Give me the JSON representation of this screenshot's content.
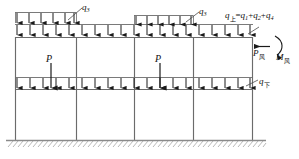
{
  "diagram": {
    "colors": {
      "structure": "#6b6b6b",
      "load": "#1a1a1a",
      "ground": "#8a8a8a",
      "text": "#111111"
    },
    "labels": {
      "q3_left": "q",
      "q3_left_sub": "3",
      "q3_right": "q",
      "q3_right_sub": "3",
      "q_upper_sym": "q",
      "q_upper_sub": "上",
      "q_upper_eq": "=",
      "q_upper_rhs_1": "q",
      "q_upper_rhs_1_sub": "1",
      "q_upper_plus_1": "+",
      "q_upper_rhs_2": "q",
      "q_upper_rhs_2_sub": "2",
      "q_upper_plus_2": "+",
      "q_upper_rhs_3": "q",
      "q_upper_rhs_3_sub": "4",
      "q_lower_sym": "q",
      "q_lower_sub": "下",
      "p_left": "P",
      "p_right": "P",
      "p_wind_sym": "P",
      "p_wind_sub": "风",
      "m_wind_sym": "M",
      "m_wind_sub": "风"
    },
    "geometry": {
      "columns_x": [
        15,
        76,
        134,
        193,
        252
      ],
      "beam_top_y": 37,
      "beam_mid_y": 89,
      "ground_y": 140,
      "udl_upper_row_y": 31,
      "udl_q3_row_y": 19,
      "udl_lower_row_y": 83,
      "q3_left_span": [
        15,
        76
      ],
      "q3_right_span": [
        134,
        193
      ],
      "point_load_x": [
        51,
        160
      ]
    }
  }
}
